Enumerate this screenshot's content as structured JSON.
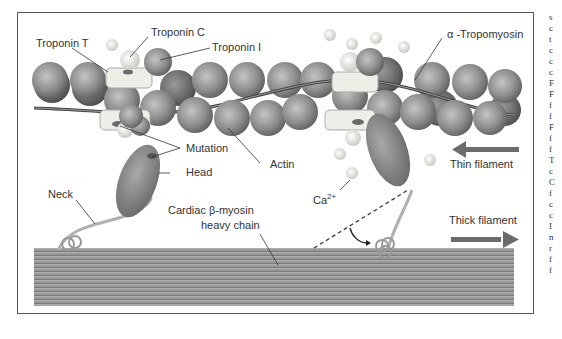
{
  "figure": {
    "type": "Diagram",
    "labels": {
      "troponin_t": "Troponin T",
      "troponin_c": "Troponin C",
      "troponin_i": "Troponin I",
      "alpha_tropomyosin": "α -Tropomyosin",
      "mutation": "Mutation",
      "actin": "Actin",
      "head": "Head",
      "neck": "Neck",
      "calcium": "Ca",
      "calcium_sup": "2+",
      "heavy_chain_line1": "Cardiac β-myosin",
      "heavy_chain_line2": "heavy chain",
      "thin_filament": "Thin filament",
      "thick_filament": "Thick filament"
    },
    "colors": {
      "actin": "#8a8a8a",
      "actin_highlight": "#bdbdbd",
      "troponin_box": "#e9ece6",
      "tropomyosin": "#555555",
      "myosin": "#8f8f8f",
      "thick_filament": "#9a9a9a",
      "arrow": "#6b6b6b",
      "calcium": "#e8e8e2",
      "frame": "#555555"
    },
    "edge_text": [
      "s",
      "c",
      "t",
      "c",
      "c",
      "c",
      "F",
      "F",
      "f",
      "f",
      "F",
      "f",
      "f",
      "T",
      "c",
      "C",
      "f",
      "c",
      "c",
      "I",
      "n",
      "r",
      "f",
      "f"
    ]
  }
}
